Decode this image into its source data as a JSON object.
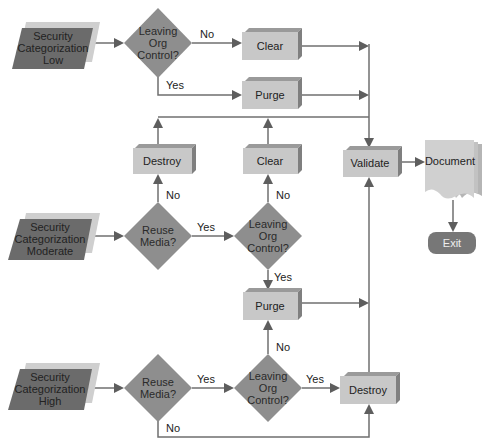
{
  "colors": {
    "parallelogram_fill": "#6b6b6b",
    "parallelogram_shadow": "#cfcfcf",
    "diamond_fill": "#8e8e8e",
    "box_fill": "#c8c8c8",
    "box_top": "#9a9a9a",
    "box_side": "#7f7f7f",
    "document_fill": "#d0d0d0",
    "exit_fill": "#777777",
    "line": "#6f6f6f"
  },
  "inputs": {
    "low": [
      "Security",
      "Categorization",
      "Low"
    ],
    "moderate": [
      "Security",
      "Categorization",
      "Moderate"
    ],
    "high": [
      "Security",
      "Categorization",
      "High"
    ]
  },
  "decisions": {
    "low_leaving": [
      "Leaving",
      "Org",
      "Control?"
    ],
    "mod_reuse": [
      "Reuse",
      "Media?"
    ],
    "mod_leaving": [
      "Leaving",
      "Org",
      "Control?"
    ],
    "high_reuse": [
      "Reuse",
      "Media?"
    ],
    "high_leaving": [
      "Leaving",
      "Org",
      "Control?"
    ]
  },
  "actions": {
    "low_clear": "Clear",
    "low_purge": "Purge",
    "mod_destroy": "Destroy",
    "mod_clear": "Clear",
    "mod_purge": "Purge",
    "high_destroy": "Destroy",
    "validate": "Validate"
  },
  "document": "Document",
  "exit": "Exit",
  "edge_labels": {
    "low_no": "No",
    "low_yes": "Yes",
    "mod_reuse_no": "No",
    "mod_reuse_yes": "Yes",
    "mod_leaving_no": "No",
    "mod_leaving_yes": "Yes",
    "purge_no": "No",
    "high_reuse_yes": "Yes",
    "high_reuse_no": "No",
    "high_leaving_yes": "Yes"
  }
}
